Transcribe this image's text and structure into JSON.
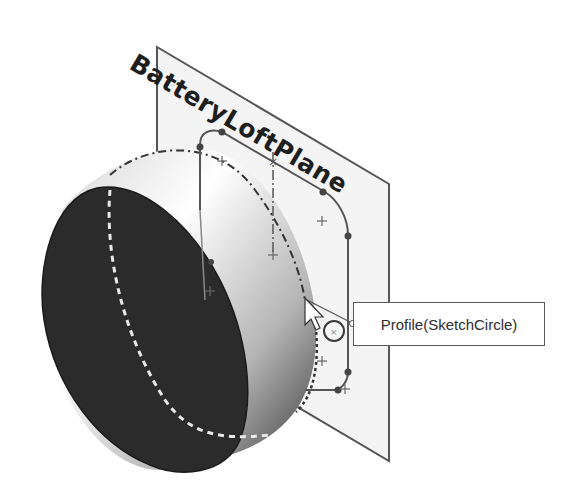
{
  "viewport": {
    "background": "#ffffff",
    "plane": {
      "label": "BatteryLoftPlane",
      "fill": "#f4f4f4",
      "edge_color": "#555555"
    },
    "body": {
      "type": "cylinder",
      "face_color": "#2b2b2b"
    },
    "sketch": {
      "shape": "rounded-rectangle",
      "line_color": "#555555"
    }
  },
  "tooltip": {
    "label": "Profile(SketchCircle)"
  },
  "cursor": {
    "icon": "arrow-cursor-icon",
    "selection_indicator": "circle-select-icon"
  }
}
